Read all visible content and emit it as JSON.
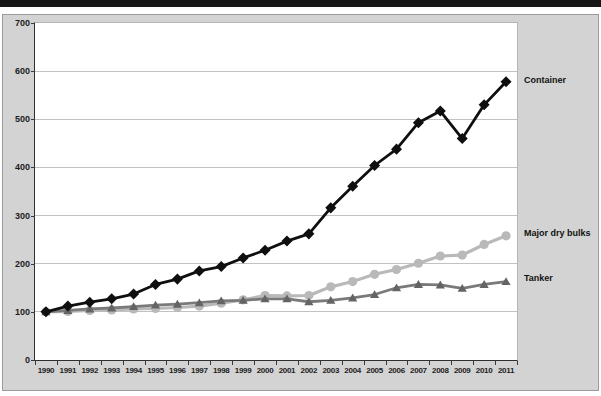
{
  "window": {
    "top_bar_color": "#161616",
    "panel_background": "#d3d3d3",
    "plot_background": "#ffffff",
    "gridline_color": "#c2c2c2"
  },
  "chart_data": {
    "type": "line",
    "title": "",
    "xlabel": "",
    "ylabel": "",
    "ylim": [
      0,
      700
    ],
    "yticks": [
      0,
      100,
      200,
      300,
      400,
      500,
      600,
      700
    ],
    "grid": true,
    "legend_position": "right-outside",
    "categories": [
      "1990",
      "1991",
      "1992",
      "1993",
      "1994",
      "1995",
      "1996",
      "1997",
      "1998",
      "1999",
      "2000",
      "2001",
      "2002",
      "2003",
      "2004",
      "2005",
      "2006",
      "2007",
      "2008",
      "2009",
      "2010",
      "2011"
    ],
    "series": [
      {
        "name": "Container",
        "marker": "diamond",
        "color": "#0f0f0f",
        "marker_color": "#0f0f0f",
        "values": [
          100,
          112,
          120,
          127,
          137,
          157,
          168,
          185,
          194,
          212,
          228,
          247,
          262,
          316,
          361,
          404,
          438,
          493,
          517,
          460,
          530,
          578
        ]
      },
      {
        "name": "Major dry bulks",
        "marker": "circle",
        "color": "#b9b9b9",
        "marker_color": "#b9b9b9",
        "values": [
          100,
          101,
          103,
          104,
          106,
          107,
          109,
          112,
          118,
          125,
          134,
          133,
          134,
          152,
          163,
          178,
          188,
          201,
          216,
          218,
          240,
          258
        ]
      },
      {
        "name": "Tanker",
        "marker": "triangle",
        "color": "#7a7a7a",
        "marker_color": "#646464",
        "values": [
          100,
          103,
          106,
          108,
          111,
          114,
          116,
          119,
          123,
          124,
          127,
          127,
          121,
          124,
          129,
          136,
          150,
          157,
          156,
          149,
          157,
          163
        ]
      }
    ]
  }
}
